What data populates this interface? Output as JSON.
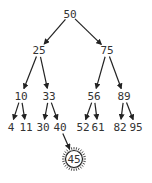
{
  "diagram": {
    "type": "binary-search-tree",
    "colors": {
      "text": "#333333",
      "edge": "#222222",
      "background": "#ffffff"
    },
    "nodes": [
      {
        "id": "n50",
        "value": "50",
        "x": 70,
        "y": 14
      },
      {
        "id": "n25",
        "value": "25",
        "x": 39,
        "y": 50
      },
      {
        "id": "n75",
        "value": "75",
        "x": 107,
        "y": 50
      },
      {
        "id": "n10",
        "value": "10",
        "x": 21,
        "y": 96
      },
      {
        "id": "n33",
        "value": "33",
        "x": 49,
        "y": 96
      },
      {
        "id": "n56",
        "value": "56",
        "x": 94,
        "y": 96
      },
      {
        "id": "n89",
        "value": "89",
        "x": 124,
        "y": 96
      },
      {
        "id": "n4",
        "value": "4",
        "x": 11,
        "y": 127
      },
      {
        "id": "n11",
        "value": "11",
        "x": 26,
        "y": 127
      },
      {
        "id": "n30",
        "value": "30",
        "x": 43,
        "y": 127
      },
      {
        "id": "n40",
        "value": "40",
        "x": 60,
        "y": 127
      },
      {
        "id": "n52",
        "value": "52",
        "x": 83,
        "y": 127
      },
      {
        "id": "n61",
        "value": "61",
        "x": 98,
        "y": 127
      },
      {
        "id": "n82",
        "value": "82",
        "x": 120,
        "y": 127
      },
      {
        "id": "n95",
        "value": "95",
        "x": 136,
        "y": 127
      },
      {
        "id": "n45",
        "value": "45",
        "x": 74,
        "y": 159,
        "highlighted": true
      }
    ],
    "edges": [
      {
        "from": "n50",
        "to": "n25"
      },
      {
        "from": "n50",
        "to": "n75"
      },
      {
        "from": "n25",
        "to": "n10"
      },
      {
        "from": "n25",
        "to": "n33"
      },
      {
        "from": "n75",
        "to": "n56"
      },
      {
        "from": "n75",
        "to": "n89"
      },
      {
        "from": "n10",
        "to": "n4"
      },
      {
        "from": "n10",
        "to": "n11"
      },
      {
        "from": "n33",
        "to": "n30"
      },
      {
        "from": "n33",
        "to": "n40"
      },
      {
        "from": "n56",
        "to": "n52"
      },
      {
        "from": "n56",
        "to": "n61"
      },
      {
        "from": "n89",
        "to": "n82"
      },
      {
        "from": "n89",
        "to": "n95"
      },
      {
        "from": "n40",
        "to": "n45"
      }
    ]
  }
}
